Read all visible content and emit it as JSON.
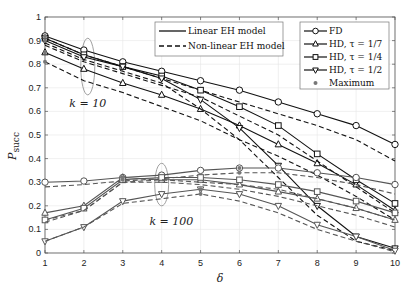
{
  "chart_data": {
    "type": "line",
    "title": "",
    "xlabel": "δ",
    "ylabel": "P_succ",
    "ylabel_main": "P",
    "ylabel_sub": "succ",
    "xlim": [
      1,
      10
    ],
    "ylim": [
      0,
      1
    ],
    "grid": true,
    "x": [
      1,
      2,
      3,
      4,
      5,
      6,
      7,
      8,
      9,
      10
    ],
    "xticks": [
      "1",
      "2",
      "3",
      "4",
      "5",
      "6",
      "7",
      "8",
      "9",
      "10"
    ],
    "yticks": [
      "0",
      "0.1",
      "0.2",
      "0.3",
      "0.4",
      "0.5",
      "0.6",
      "0.7",
      "0.8",
      "0.9",
      "1"
    ],
    "legend_model": [
      {
        "label": "Linear EH model",
        "style": "solid"
      },
      {
        "label": "Non-linear EH model",
        "style": "dashed"
      }
    ],
    "legend_scheme": [
      {
        "label": "FD",
        "marker": "circle"
      },
      {
        "label": "HD, τ = 1/7",
        "marker": "triangle-up"
      },
      {
        "label": "HD, τ = 1/4",
        "marker": "square"
      },
      {
        "label": "HD, τ = 1/2",
        "marker": "triangle-down"
      },
      {
        "label": "Maximum",
        "marker": "dot"
      }
    ],
    "annotations": [
      "k = 10",
      "k = 100"
    ],
    "series": [
      {
        "name": "FD, linear, k=10",
        "k": 10,
        "model": "linear",
        "marker": "circle",
        "values": [
          0.92,
          0.86,
          0.81,
          0.77,
          0.73,
          0.69,
          0.64,
          0.59,
          0.54,
          0.46
        ]
      },
      {
        "name": "FD, non-linear, k=10",
        "k": 10,
        "model": "non-linear",
        "marker": "none",
        "values": [
          0.91,
          0.84,
          0.79,
          0.74,
          0.69,
          0.64,
          0.59,
          0.54,
          0.48,
          0.39
        ]
      },
      {
        "name": "HD τ=1/7, linear, k=10",
        "k": 10,
        "model": "linear",
        "marker": "triangle-up",
        "values": [
          0.85,
          0.78,
          0.72,
          0.67,
          0.61,
          0.54,
          0.46,
          0.38,
          0.29,
          0.18
        ]
      },
      {
        "name": "HD τ=1/7, non-linear, k=10",
        "k": 10,
        "model": "non-linear",
        "marker": "none",
        "values": [
          0.81,
          0.73,
          0.68,
          0.62,
          0.56,
          0.48,
          0.41,
          0.33,
          0.24,
          0.14
        ]
      },
      {
        "name": "HD τ=1/4, linear, k=10",
        "k": 10,
        "model": "linear",
        "marker": "square",
        "values": [
          0.91,
          0.84,
          0.79,
          0.75,
          0.69,
          0.62,
          0.54,
          0.42,
          0.31,
          0.21
        ]
      },
      {
        "name": "HD τ=1/4, non-linear, k=10",
        "k": 10,
        "model": "non-linear",
        "marker": "none",
        "values": [
          0.88,
          0.81,
          0.76,
          0.71,
          0.66,
          0.58,
          0.5,
          0.39,
          0.28,
          0.17
        ]
      },
      {
        "name": "HD τ=1/2, linear, k=10",
        "k": 10,
        "model": "linear",
        "marker": "triangle-down",
        "values": [
          0.9,
          0.83,
          0.79,
          0.74,
          0.65,
          0.53,
          0.37,
          0.2,
          0.07,
          0.02
        ]
      },
      {
        "name": "HD τ=1/2, non-linear, k=10",
        "k": 10,
        "model": "non-linear",
        "marker": "none",
        "values": [
          0.89,
          0.82,
          0.77,
          0.72,
          0.61,
          0.48,
          0.32,
          0.16,
          0.05,
          0.01
        ]
      },
      {
        "name": "FD, linear, k=100",
        "k": 100,
        "model": "linear",
        "marker": "circle",
        "values": [
          0.3,
          0.305,
          0.32,
          0.33,
          0.35,
          0.36,
          0.36,
          0.34,
          0.32,
          0.29
        ]
      },
      {
        "name": "FD, non-linear, k=100",
        "k": 100,
        "model": "non-linear",
        "marker": "none",
        "values": [
          0.28,
          0.29,
          0.305,
          0.315,
          0.33,
          0.34,
          0.34,
          0.32,
          0.29,
          0.25
        ]
      },
      {
        "name": "HD τ=1/7, linear, k=100",
        "k": 100,
        "model": "linear",
        "marker": "triangle-up",
        "values": [
          0.17,
          0.2,
          0.32,
          0.31,
          0.31,
          0.29,
          0.26,
          0.23,
          0.19,
          0.14
        ]
      },
      {
        "name": "HD τ=1/7, non-linear, k=100",
        "k": 100,
        "model": "non-linear",
        "marker": "none",
        "values": [
          0.14,
          0.18,
          0.3,
          0.3,
          0.29,
          0.27,
          0.24,
          0.2,
          0.16,
          0.11
        ]
      },
      {
        "name": "HD τ=1/4, linear, k=100",
        "k": 100,
        "model": "linear",
        "marker": "square",
        "values": [
          0.14,
          0.19,
          0.31,
          0.32,
          0.32,
          0.31,
          0.29,
          0.26,
          0.22,
          0.17
        ]
      },
      {
        "name": "HD τ=1/4, non-linear, k=100",
        "k": 100,
        "model": "non-linear",
        "marker": "none",
        "values": [
          0.13,
          0.18,
          0.3,
          0.31,
          0.3,
          0.29,
          0.27,
          0.23,
          0.19,
          0.14
        ]
      },
      {
        "name": "HD τ=1/2, linear, k=100",
        "k": 100,
        "model": "linear",
        "marker": "triangle-down",
        "values": [
          0.05,
          0.11,
          0.22,
          0.25,
          0.27,
          0.25,
          0.2,
          0.12,
          0.07,
          0.01
        ]
      },
      {
        "name": "HD τ=1/2, non-linear, k=100",
        "k": 100,
        "model": "non-linear",
        "marker": "none",
        "values": [
          0.05,
          0.11,
          0.21,
          0.23,
          0.25,
          0.22,
          0.17,
          0.1,
          0.05,
          0.005
        ]
      }
    ],
    "maxima": [
      {
        "x": 1,
        "y": 0.92
      },
      {
        "x": 1,
        "y": 0.9
      },
      {
        "x": 1,
        "y": 0.85
      },
      {
        "x": 1,
        "y": 0.81
      },
      {
        "x": 3,
        "y": 0.32
      },
      {
        "x": 3,
        "y": 0.31
      },
      {
        "x": 5,
        "y": 0.27
      },
      {
        "x": 5,
        "y": 0.25
      },
      {
        "x": 6,
        "y": 0.36
      },
      {
        "x": 6,
        "y": 0.34
      }
    ],
    "ellipses": [
      {
        "cx": 2.1,
        "cy": 0.79,
        "rx": 0.4,
        "ry": 0.12,
        "label": "k = 10",
        "label_x": 2.1,
        "label_y": 0.62
      },
      {
        "cx": 4.0,
        "cy": 0.29,
        "rx": 0.4,
        "ry": 0.09,
        "label": "k = 100",
        "label_x": 4.25,
        "label_y": 0.12
      }
    ]
  }
}
